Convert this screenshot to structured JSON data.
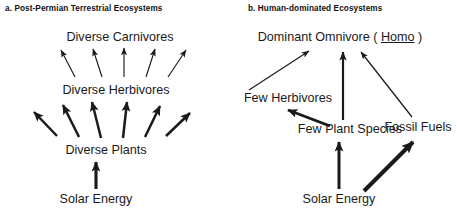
{
  "figure": {
    "background_color": "#ffffff",
    "ink_color": "#1a1a1a",
    "panels": [
      {
        "id": "a",
        "title": "a.  Post-Permian Terrestrial Ecosystems",
        "nodes": [
          {
            "key": "carnivores",
            "label": "Diverse Carnivores",
            "x": 120,
            "y": 37
          },
          {
            "key": "herbivores",
            "label": "Diverse Herbivores",
            "x": 116,
            "y": 90
          },
          {
            "key": "plants",
            "label": "Diverse Plants",
            "x": 106,
            "y": 150
          },
          {
            "key": "solar",
            "label": "Solar Energy",
            "x": 96,
            "y": 199
          }
        ],
        "flows": [
          {
            "from": "herbivores",
            "to": "carnivores",
            "count": 5,
            "weight": "thin",
            "description": "five thin diverging arrows"
          },
          {
            "from": "plants",
            "to": "herbivores",
            "count": 6,
            "weight": "thick",
            "description": "six thick diverging arrows"
          },
          {
            "from": "solar",
            "to": "plants",
            "count": 1,
            "weight": "thick",
            "description": "single vertical thick arrow"
          }
        ]
      },
      {
        "id": "b",
        "title": "b.  Human-dominated  Ecosystems",
        "nodes": [
          {
            "key": "omnivore",
            "label_prefix": "Dominant Omnivore ( ",
            "label_genus": "Homo",
            "label_suffix": " )",
            "x": 340,
            "y": 37
          },
          {
            "key": "herbivores",
            "label": "Few Herbivores",
            "x": 288,
            "y": 98
          },
          {
            "key": "plants",
            "label": "Few Plant Species",
            "x": 350,
            "y": 129
          },
          {
            "key": "fossil",
            "label": "Fossil Fuels",
            "x": 418,
            "y": 127
          },
          {
            "key": "solar",
            "label": "Solar Energy",
            "x": 339,
            "y": 199
          }
        ],
        "flows": [
          {
            "from": "herbivores",
            "to": "omnivore",
            "count": 1,
            "weight": "thin",
            "description": "thin diagonal arrow up-right"
          },
          {
            "from": "plants",
            "to": "omnivore",
            "count": 1,
            "weight": "medium",
            "description": "vertical arrow"
          },
          {
            "from": "fossil",
            "to": "omnivore",
            "count": 1,
            "weight": "thin",
            "description": "thin diagonal arrow up-left"
          },
          {
            "from": "plants",
            "to": "herbivores",
            "count": 1,
            "weight": "thick",
            "description": "thick diagonal arrow up-left"
          },
          {
            "from": "solar",
            "to": "plants",
            "count": 1,
            "weight": "thick",
            "description": "vertical thick arrow"
          },
          {
            "from": "solar",
            "to": "fossil",
            "count": 1,
            "weight": "extra-thick",
            "description": "very thick diagonal arrow up-right"
          }
        ]
      }
    ],
    "caption_fragment": ""
  }
}
